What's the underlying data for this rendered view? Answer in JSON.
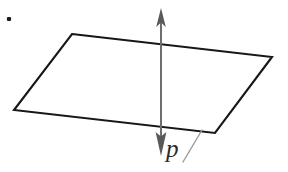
{
  "figure": {
    "background_color": "#ffffff",
    "width": 288,
    "height": 172,
    "bullet": {
      "name": "list-bullet",
      "cx": 9,
      "cy": 19,
      "size": 4.2,
      "color": "#1a1a1a"
    },
    "plane": {
      "name": "parallelogram-plane",
      "stroke_color": "#171717",
      "stroke_width": 2.1,
      "fill": "none",
      "points": "72,34 272,57 215,133 14,110",
      "vertices": [
        {
          "label": "top-left",
          "x": 72,
          "y": 34
        },
        {
          "label": "right",
          "x": 272,
          "y": 57
        },
        {
          "label": "bottom-right",
          "x": 215,
          "y": 133
        },
        {
          "label": "left",
          "x": 14,
          "y": 110
        }
      ]
    },
    "axis": {
      "name": "normal-vector-axis",
      "stroke_color": "#6e6e6e",
      "stroke_width": 2.0,
      "x": 161,
      "top_y": 8,
      "bottom_y": 156,
      "arrowhead_color": "#5a5a5a",
      "arrow_up": "161,8 156.2,26 161,22.5 165.8,26",
      "arrow_down": "161,156 155.6,133 161,136.5 166.4,133"
    },
    "leader": {
      "name": "label-leader-line",
      "x1": 183,
      "y1": 162,
      "x2": 202,
      "y2": 130,
      "stroke_color": "#9a9a9a",
      "stroke_width": 1.4
    },
    "label": {
      "name": "vector-label-p",
      "text": "p"
    }
  }
}
